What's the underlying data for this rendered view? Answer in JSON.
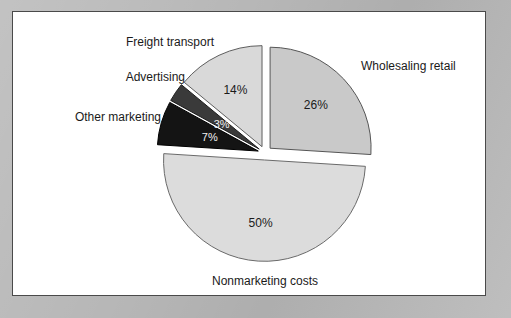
{
  "figure": {
    "frame_color": "#b7b7b7",
    "panel_color": "#ffffff",
    "panel_border_color": "#4a4a4a"
  },
  "chart_data": {
    "type": "pie",
    "title": "",
    "subtitle": "",
    "xlabel": "",
    "ylabel": "",
    "grid": false,
    "legend_position": "none",
    "labels_placement": "outside-callout-text-and-inside-percent",
    "exploded": true,
    "units": "percent",
    "total": 100,
    "categories": [
      "Wholesaling retail",
      "Nonmarketing costs",
      "Other marketing",
      "Advertising",
      "Freight transport"
    ],
    "values": [
      26,
      50,
      7,
      3,
      14
    ],
    "value_labels": [
      "26%",
      "50%",
      "7%",
      "3%",
      "14%"
    ],
    "colors": [
      "#c9c9c9",
      "#dcdcdc",
      "#141414",
      "#3a3a3a",
      "#d9d9d9"
    ],
    "slices": [
      {
        "name": "Wholesaling retail",
        "value": 26,
        "value_label": "26%",
        "label": "Wholesaling retail",
        "color": "#c9c9c9",
        "edge_color": "#565656",
        "value_text_color": "#1a1a1a",
        "start_angle_deg": 0,
        "end_angle_deg": 93.6
      },
      {
        "name": "Nonmarketing costs",
        "value": 50,
        "value_label": "50%",
        "label": "Nonmarketing costs",
        "color": "#dcdcdc",
        "edge_color": "#6a6a6a",
        "value_text_color": "#1a1a1a",
        "start_angle_deg": 93.6,
        "end_angle_deg": 273.6
      },
      {
        "name": "Other marketing",
        "value": 7,
        "value_label": "7%",
        "label": "Other marketing",
        "color": "#141414",
        "edge_color": "#000000",
        "value_text_color": "#f2f2f2",
        "start_angle_deg": 273.6,
        "end_angle_deg": 298.8
      },
      {
        "name": "Advertising",
        "value": 3,
        "value_label": "3%",
        "label": "Advertising",
        "color": "#3a3a3a",
        "edge_color": "#1d1d1d",
        "value_text_color": "#f2f2f2",
        "start_angle_deg": 298.8,
        "end_angle_deg": 309.6
      },
      {
        "name": "Freight transport",
        "value": 14,
        "value_label": "14%",
        "label": "Freight transport",
        "color": "#d9d9d9",
        "edge_color": "#5e5e5e",
        "value_text_color": "#1a1a1a",
        "start_angle_deg": 309.6,
        "end_angle_deg": 360
      }
    ],
    "callout_labels": [
      {
        "text": "Freight transport",
        "for": "Freight transport",
        "anchor": "end"
      },
      {
        "text": "Advertising",
        "for": "Advertising",
        "anchor": "end"
      },
      {
        "text": "Other marketing",
        "for": "Other marketing",
        "anchor": "end"
      },
      {
        "text": "Wholesaling retail",
        "for": "Wholesaling retail",
        "anchor": "start"
      },
      {
        "text": "Nonmarketing costs",
        "for": "Nonmarketing costs",
        "anchor": "middle"
      }
    ]
  }
}
